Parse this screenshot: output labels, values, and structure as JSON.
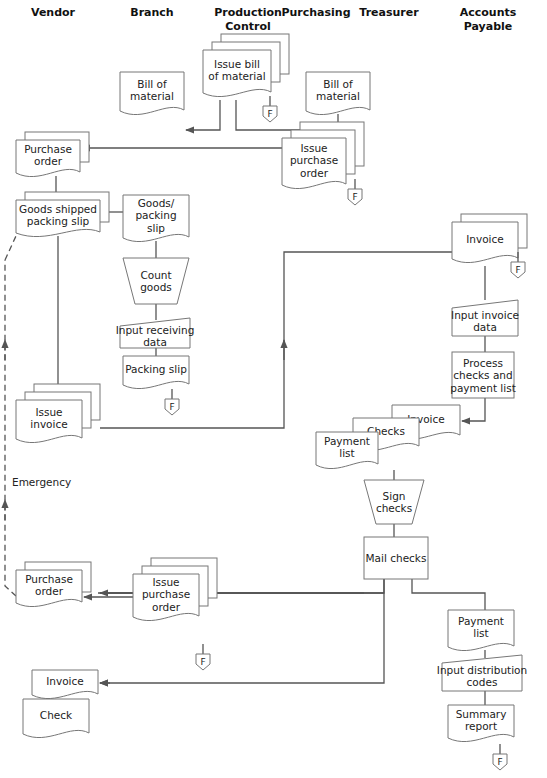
{
  "columns": [
    {
      "id": "vendor",
      "label": [
        "Vendor"
      ]
    },
    {
      "id": "branch",
      "label": [
        "Branch"
      ]
    },
    {
      "id": "production_control",
      "label": [
        "Production",
        "Control"
      ]
    },
    {
      "id": "purchasing",
      "label": [
        "Purchasing"
      ]
    },
    {
      "id": "treasurer",
      "label": [
        "Treasurer"
      ]
    },
    {
      "id": "accounts_payable",
      "label": [
        "Accounts",
        "Payable"
      ]
    }
  ],
  "nodes": {
    "issue_bom": {
      "type": "multi-document",
      "lines": [
        "Issue bill",
        "of material"
      ],
      "lane": "production_control"
    },
    "bom_branch": {
      "type": "document",
      "lines": [
        "Bill of",
        "material"
      ],
      "lane": "branch"
    },
    "bom_purchasing": {
      "type": "document",
      "lines": [
        "Bill of",
        "material"
      ],
      "lane": "purchasing"
    },
    "issue_po_purchasing": {
      "type": "multi-document",
      "lines": [
        "Issue",
        "purchase",
        "order"
      ],
      "lane": "purchasing"
    },
    "po_vendor": {
      "type": "multi-document",
      "lines": [
        "Purchase",
        "order"
      ],
      "lane": "vendor"
    },
    "goods_shipped": {
      "type": "multi-document",
      "lines": [
        "Goods shipped",
        "packing slip"
      ],
      "lane": "vendor"
    },
    "goods_packing_slip": {
      "type": "document",
      "lines": [
        "Goods/",
        "packing",
        "slip"
      ],
      "lane": "branch"
    },
    "count_goods": {
      "type": "manual-operation",
      "lines": [
        "Count",
        "goods"
      ],
      "lane": "branch"
    },
    "input_receiving": {
      "type": "manual-input",
      "lines": [
        "Input receiving",
        "data"
      ],
      "lane": "branch"
    },
    "packing_slip": {
      "type": "document",
      "lines": [
        "Packing slip"
      ],
      "lane": "branch"
    },
    "issue_invoice": {
      "type": "multi-document",
      "lines": [
        "Issue",
        "invoice"
      ],
      "lane": "vendor"
    },
    "invoice_ap": {
      "type": "multi-document",
      "lines": [
        "Invoice"
      ],
      "lane": "accounts_payable"
    },
    "input_invoice": {
      "type": "manual-input",
      "lines": [
        "Input invoice",
        "data"
      ],
      "lane": "accounts_payable"
    },
    "process_checks": {
      "type": "process",
      "lines": [
        "Process",
        "checks and",
        "payment list"
      ],
      "lane": "accounts_payable"
    },
    "invoice_treasurer": {
      "type": "document",
      "lines": [
        "Invoice"
      ],
      "lane": "treasurer"
    },
    "checks": {
      "type": "document",
      "lines": [
        "Checks"
      ],
      "lane": "treasurer"
    },
    "payment_list_treasurer": {
      "type": "document",
      "lines": [
        "Payment",
        "list"
      ],
      "lane": "treasurer"
    },
    "sign_checks": {
      "type": "manual-operation",
      "lines": [
        "Sign",
        "checks"
      ],
      "lane": "treasurer"
    },
    "mail_checks": {
      "type": "process",
      "lines": [
        "Mail checks"
      ],
      "lane": "treasurer"
    },
    "emergency_po": {
      "type": "multi-document",
      "lines": [
        "Purchase",
        "order"
      ],
      "lane": "vendor"
    },
    "issue_po_branch": {
      "type": "multi-document",
      "lines": [
        "Issue",
        "purchase",
        "order"
      ],
      "lane": "branch"
    },
    "invoice_vendor": {
      "type": "document",
      "lines": [
        "Invoice"
      ],
      "lane": "vendor"
    },
    "check_vendor": {
      "type": "document",
      "lines": [
        "Check"
      ],
      "lane": "vendor"
    },
    "payment_list_ap": {
      "type": "document",
      "lines": [
        "Payment",
        "list"
      ],
      "lane": "accounts_payable"
    },
    "input_distribution": {
      "type": "manual-input",
      "lines": [
        "Input distribution",
        "codes"
      ],
      "lane": "accounts_payable"
    },
    "summary_report": {
      "type": "document",
      "lines": [
        "Summary",
        "report"
      ],
      "lane": "accounts_payable"
    }
  },
  "file_label": "F",
  "emergency_label": "Emergency"
}
